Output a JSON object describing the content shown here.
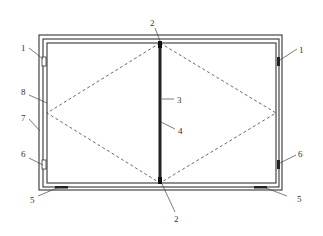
{
  "diagram": {
    "type": "technical-drawing",
    "labels": {
      "l1_left": "1",
      "l1_right": "1",
      "l2_top": "2",
      "l2_bottom": "2",
      "l3": "3",
      "l4": "4",
      "l5_left": "5",
      "l5_right": "5",
      "l6_left": "6",
      "l6_right": "6",
      "l7": "7",
      "l8": "8"
    },
    "components": [
      {
        "id": "1",
        "description": "upper side clip (left and right)"
      },
      {
        "id": "2",
        "description": "divider end block (top and bottom)"
      },
      {
        "id": "3",
        "description": "central divider bar"
      },
      {
        "id": "4",
        "description": "divider core"
      },
      {
        "id": "5",
        "description": "bottom support pad (left and right)"
      },
      {
        "id": "6",
        "description": "lower side clip (left and right)"
      },
      {
        "id": "7",
        "description": "outer frame"
      },
      {
        "id": "8",
        "description": "inner panel"
      }
    ]
  }
}
